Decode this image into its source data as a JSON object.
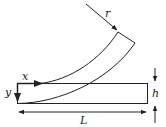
{
  "diagram": {
    "labels": {
      "radius": "r",
      "x_axis": "x",
      "y_axis": "y",
      "thickness": "h",
      "length": "L"
    },
    "colors": {
      "stroke": "#222222",
      "background": "#ffffff"
    }
  }
}
